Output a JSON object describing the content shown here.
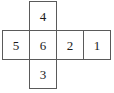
{
  "diagram": {
    "type": "cube-net",
    "shape": "cross",
    "grid": {
      "columns": 4,
      "rows": 3
    },
    "border_color": "#5a5a5a",
    "background_color": "#ffffff",
    "text_color": "#1a1a1a",
    "cells": [
      {
        "id": "cell-top",
        "label": "4",
        "row": 0,
        "col": 1
      },
      {
        "id": "cell-middle-left",
        "label": "5",
        "row": 1,
        "col": 0
      },
      {
        "id": "cell-middle-center",
        "label": "6",
        "row": 1,
        "col": 1
      },
      {
        "id": "cell-middle-right",
        "label": "2",
        "row": 1,
        "col": 2
      },
      {
        "id": "cell-middle-far",
        "label": "1",
        "row": 1,
        "col": 3
      },
      {
        "id": "cell-bottom",
        "label": "3",
        "row": 2,
        "col": 1
      }
    ]
  }
}
